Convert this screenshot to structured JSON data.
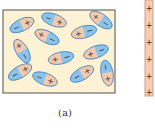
{
  "figure": {
    "caption": "(a)",
    "colors": {
      "box_fill": "#fdf3d4",
      "box_stroke": "#6b6b6b",
      "negative_fill": "#8cc3ea",
      "negative_stroke": "#3d7fc1",
      "positive_fill": "#f5c9ac",
      "positive_stroke": "#c98a6a",
      "plate_fill": "#f7cdb3",
      "plate_stroke": "#c98a6a",
      "sign_color": "#333333"
    },
    "box": {
      "x": 3,
      "y": 10,
      "width": 112,
      "height": 83
    },
    "dipoles": [
      {
        "cx": 22,
        "cy": 25,
        "angle": -25,
        "neg_side": "left"
      },
      {
        "cx": 54,
        "cy": 20,
        "angle": 20,
        "neg_side": "left"
      },
      {
        "cx": 101,
        "cy": 20,
        "angle": 35,
        "neg_side": "right"
      },
      {
        "cx": 47,
        "cy": 37,
        "angle": 25,
        "neg_side": "right"
      },
      {
        "cx": 84,
        "cy": 32,
        "angle": -15,
        "neg_side": "right"
      },
      {
        "cx": 22,
        "cy": 51,
        "angle": 60,
        "neg_side": "right"
      },
      {
        "cx": 61,
        "cy": 58,
        "angle": -12,
        "neg_side": "right"
      },
      {
        "cx": 96,
        "cy": 52,
        "angle": -20,
        "neg_side": "right"
      },
      {
        "cx": 20,
        "cy": 72,
        "angle": -30,
        "neg_side": "left"
      },
      {
        "cx": 45,
        "cy": 79,
        "angle": 20,
        "neg_side": "left"
      },
      {
        "cx": 82,
        "cy": 74,
        "angle": -30,
        "neg_side": "left"
      },
      {
        "cx": 107,
        "cy": 73,
        "angle": 80,
        "neg_side": "left"
      }
    ],
    "plate": {
      "x": 145,
      "y": 0,
      "width": 8,
      "height": 96,
      "sign": "+",
      "sign_positions_y": [
        8,
        25,
        42,
        59,
        76,
        92
      ]
    },
    "negative_sign": "−",
    "positive_sign": "+"
  }
}
